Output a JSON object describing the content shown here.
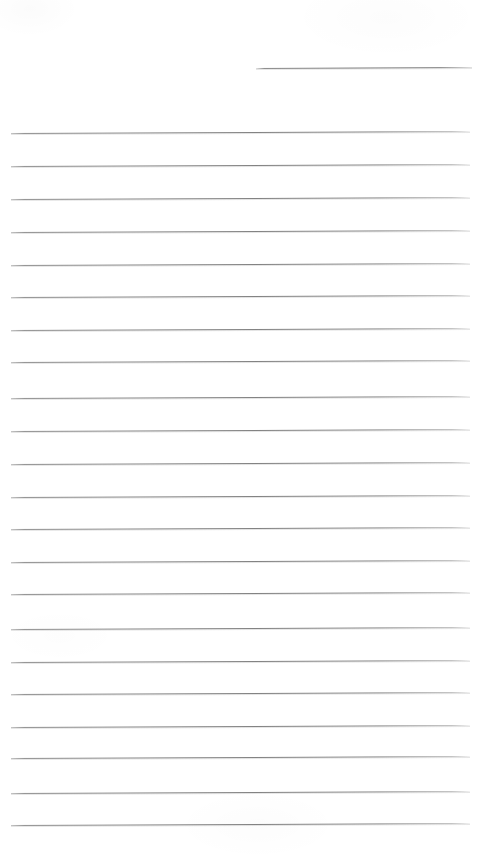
{
  "page": {
    "kind": "scanned-lined-notepad-page",
    "width": 495,
    "height": 859,
    "background_color": "#ffffff",
    "rule_color": "#808080",
    "text_content": "",
    "handwriting_present": "no",
    "printed_text_present": "no"
  },
  "header_rule": {
    "name": "header-rule",
    "x_start": 256,
    "x_end": 472,
    "y": 68,
    "skew_px": -1
  },
  "body_rules": [
    {
      "y": 133,
      "x_start": 11,
      "x_end": 470,
      "skew_px": -2
    },
    {
      "y": 166,
      "x_start": 11,
      "x_end": 470,
      "skew_px": -2
    },
    {
      "y": 199,
      "x_start": 11,
      "x_end": 470,
      "skew_px": -2
    },
    {
      "y": 232,
      "x_start": 11,
      "x_end": 470,
      "skew_px": -2
    },
    {
      "y": 265,
      "x_start": 11,
      "x_end": 470,
      "skew_px": -2
    },
    {
      "y": 297,
      "x_start": 11,
      "x_end": 470,
      "skew_px": -2
    },
    {
      "y": 330,
      "x_start": 11,
      "x_end": 470,
      "skew_px": -2
    },
    {
      "y": 362,
      "x_start": 11,
      "x_end": 470,
      "skew_px": -2
    },
    {
      "y": 398,
      "x_start": 11,
      "x_end": 470,
      "skew_px": -2
    },
    {
      "y": 431,
      "x_start": 11,
      "x_end": 470,
      "skew_px": -2
    },
    {
      "y": 464,
      "x_start": 11,
      "x_end": 470,
      "skew_px": -2
    },
    {
      "y": 497,
      "x_start": 11,
      "x_end": 470,
      "skew_px": -2
    },
    {
      "y": 529,
      "x_start": 11,
      "x_end": 470,
      "skew_px": -2
    },
    {
      "y": 562,
      "x_start": 11,
      "x_end": 470,
      "skew_px": -2
    },
    {
      "y": 594,
      "x_start": 11,
      "x_end": 470,
      "skew_px": -2
    },
    {
      "y": 629,
      "x_start": 11,
      "x_end": 470,
      "skew_px": -2
    },
    {
      "y": 662,
      "x_start": 11,
      "x_end": 470,
      "skew_px": -2
    },
    {
      "y": 694,
      "x_start": 11,
      "x_end": 470,
      "skew_px": -2
    },
    {
      "y": 727,
      "x_start": 11,
      "x_end": 470,
      "skew_px": -2
    },
    {
      "y": 758,
      "x_start": 11,
      "x_end": 470,
      "skew_px": -2
    },
    {
      "y": 793,
      "x_start": 11,
      "x_end": 470,
      "skew_px": -2
    },
    {
      "y": 825,
      "x_start": 11,
      "x_end": 470,
      "skew_px": -2
    }
  ]
}
